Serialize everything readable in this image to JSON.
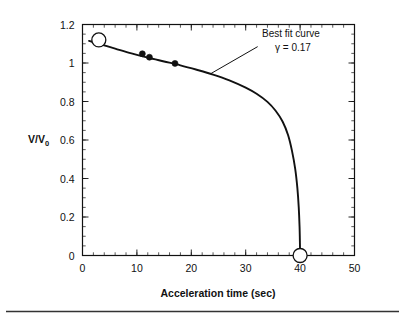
{
  "chart_data": {
    "type": "line",
    "title": "",
    "xlabel": "Acceleration time (sec)",
    "ylabel": "V/V",
    "ylabel_subscript": "0",
    "xlim": [
      0,
      50
    ],
    "ylim": [
      0,
      1.2
    ],
    "grid": false,
    "legend_position": "none",
    "x_ticks": [
      0,
      10,
      20,
      30,
      40,
      50
    ],
    "x_tick_labels": [
      "0",
      "10",
      "20",
      "30",
      "40",
      "50"
    ],
    "x_minor_step": 2,
    "y_ticks": [
      0,
      0.2,
      0.4,
      0.6,
      0.8,
      1.0,
      1.2
    ],
    "y_tick_labels": [
      "0",
      "0.2",
      "0.4",
      "0.6",
      "0.8",
      "1",
      "1.2"
    ],
    "y_minor_step": 0.05,
    "series": [
      {
        "name": "Best fit curve",
        "style": "line",
        "points": [
          {
            "x": 1.2,
            "y": 1.115
          },
          {
            "x": 3.0,
            "y": 1.1
          },
          {
            "x": 6.0,
            "y": 1.075
          },
          {
            "x": 9.0,
            "y": 1.05
          },
          {
            "x": 12.0,
            "y": 1.028
          },
          {
            "x": 15.0,
            "y": 1.008
          },
          {
            "x": 18.0,
            "y": 0.988
          },
          {
            "x": 21.0,
            "y": 0.965
          },
          {
            "x": 24.0,
            "y": 0.94
          },
          {
            "x": 27.0,
            "y": 0.91
          },
          {
            "x": 30.0,
            "y": 0.872
          },
          {
            "x": 32.0,
            "y": 0.84
          },
          {
            "x": 34.0,
            "y": 0.798
          },
          {
            "x": 35.5,
            "y": 0.752
          },
          {
            "x": 36.8,
            "y": 0.695
          },
          {
            "x": 37.8,
            "y": 0.625
          },
          {
            "x": 38.5,
            "y": 0.545
          },
          {
            "x": 39.1,
            "y": 0.45
          },
          {
            "x": 39.5,
            "y": 0.35
          },
          {
            "x": 39.75,
            "y": 0.25
          },
          {
            "x": 39.9,
            "y": 0.15
          },
          {
            "x": 39.97,
            "y": 0.06
          },
          {
            "x": 40.0,
            "y": 0.0
          }
        ]
      },
      {
        "name": "Measured data",
        "style": "filled-circle",
        "points": [
          {
            "x": 11.0,
            "y": 1.048
          },
          {
            "x": 12.3,
            "y": 1.03
          },
          {
            "x": 17.0,
            "y": 0.998
          }
        ]
      },
      {
        "name": "Endpoints",
        "style": "open-circle",
        "points": [
          {
            "x": 3.0,
            "y": 1.12
          },
          {
            "x": 40.0,
            "y": 0.0
          }
        ]
      }
    ],
    "annotations": [
      {
        "name": "best-fit-annotation",
        "line1": "Best fit curve",
        "line2_symbol": "γ",
        "line2_rest": " = 0.17",
        "text_x": 33.0,
        "text_y": 1.135,
        "leader_from_x": 32.2,
        "leader_from_y": 1.085,
        "leader_to_x": 23.6,
        "leader_to_y": 0.945
      }
    ]
  },
  "figure": {
    "background_color": "#ffffff",
    "ink_color": "#111111",
    "bottom_rule_color": "#333333"
  }
}
